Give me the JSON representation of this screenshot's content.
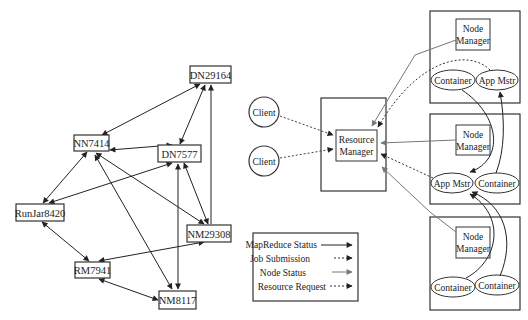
{
  "left_graph": {
    "nodes": [
      {
        "id": "DN29164",
        "label": "DN29164"
      },
      {
        "id": "NN7414",
        "label": "NN7414"
      },
      {
        "id": "DN7577",
        "label": "DN7577"
      },
      {
        "id": "RunJar8420",
        "label": "RunJar8420"
      },
      {
        "id": "NM29308",
        "label": "NM29308"
      },
      {
        "id": "RM7941",
        "label": "RM7941"
      },
      {
        "id": "NM8117",
        "label": "NM8117"
      }
    ],
    "edges": [
      {
        "from": "NN7414",
        "to": "DN29164",
        "dir": "both"
      },
      {
        "from": "DN7577",
        "to": "DN29164",
        "dir": "both"
      },
      {
        "from": "NM29308",
        "to": "DN29164",
        "dir": "forward"
      },
      {
        "from": "NN7414",
        "to": "DN7577",
        "dir": "both"
      },
      {
        "from": "NN7414",
        "to": "RunJar8420",
        "dir": "both"
      },
      {
        "from": "NN7414",
        "to": "NM29308",
        "dir": "both"
      },
      {
        "from": "NN7414",
        "to": "NM8117",
        "dir": "both"
      },
      {
        "from": "DN7577",
        "to": "RunJar8420",
        "dir": "both"
      },
      {
        "from": "DN7577",
        "to": "NM29308",
        "dir": "both"
      },
      {
        "from": "DN7577",
        "to": "NM8117",
        "dir": "both"
      },
      {
        "from": "RunJar8420",
        "to": "RM7941",
        "dir": "both"
      },
      {
        "from": "NM29308",
        "to": "RM7941",
        "dir": "both"
      },
      {
        "from": "RM7941",
        "to": "NM8117",
        "dir": "both"
      }
    ]
  },
  "right_diagram": {
    "clients": [
      {
        "label": "Client"
      },
      {
        "label": "Client"
      }
    ],
    "resource_manager": {
      "line1": "Resource",
      "line2": "Manager"
    },
    "nodes": [
      {
        "nm_line1": "Node",
        "nm_line2": "Manager",
        "ellipses": [
          "Container",
          "App Mstr"
        ]
      },
      {
        "nm_line1": "Node",
        "nm_line2": "Manager",
        "ellipses": [
          "App Mstr",
          "Container"
        ]
      },
      {
        "nm_line1": "Node",
        "nm_line2": "Manager",
        "ellipses": [
          "Container",
          "Container"
        ]
      }
    ],
    "legend": [
      {
        "label": "MapReduce Status",
        "style": "solid-black"
      },
      {
        "label": "Job Submission",
        "style": "dotted-black"
      },
      {
        "label": "Node Status",
        "style": "solid-gray"
      },
      {
        "label": "Resource Request",
        "style": "dotted-black"
      }
    ]
  },
  "colors": {
    "line": "#222222",
    "gray": "#777777",
    "box": "#333333"
  }
}
